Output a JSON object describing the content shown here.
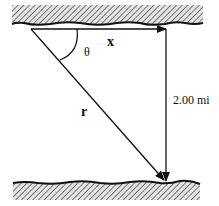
{
  "diagram": {
    "labels": {
      "x_vector": "x",
      "r_vector": "r",
      "angle": "θ",
      "distance": "2.00 mi"
    },
    "colors": {
      "ink": "#111111",
      "hatch_bg": "#d8d8d8",
      "background": "#ffffff"
    }
  }
}
